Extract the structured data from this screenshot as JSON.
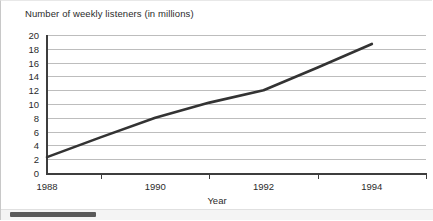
{
  "chart_data": {
    "type": "line",
    "title": "Number of weekly listeners (in millions)",
    "xlabel": "Year",
    "ylabel": "",
    "x": [
      1988,
      1989,
      1990,
      1991,
      1992,
      1993,
      1994
    ],
    "values": [
      2.3,
      5.2,
      8.0,
      10.2,
      12.0,
      15.3,
      18.7
    ],
    "series": [
      {
        "name": "Weekly listeners",
        "values": [
          2.3,
          5.2,
          8.0,
          10.2,
          12.0,
          15.3,
          18.7
        ]
      }
    ],
    "xlim": [
      1988,
      1995
    ],
    "ylim": [
      0,
      20
    ],
    "y_ticks": [
      0,
      2,
      4,
      6,
      8,
      10,
      12,
      14,
      16,
      18,
      20
    ],
    "y_tick_labels": [
      "0",
      "2",
      "4",
      "6",
      "8",
      "10",
      "12",
      "14",
      "16",
      "18",
      "20"
    ],
    "x_tick_labels": [
      "1988",
      "1990",
      "1992",
      "1994"
    ],
    "x_tick_label_positions": [
      1988,
      1990,
      1992,
      1994
    ],
    "x_tick_mark_positions": [
      1989,
      1991,
      1993
    ],
    "grid": true,
    "grid_axis": "y",
    "legend": false,
    "legend_position": "none",
    "line_color": "#333333",
    "grid_color": "#bdbdbd",
    "axis_color": "#3d3d3d"
  },
  "scrollbar": {
    "orientation": "horizontal",
    "thumb_position_percent": 2,
    "thumb_width_percent": 20
  }
}
